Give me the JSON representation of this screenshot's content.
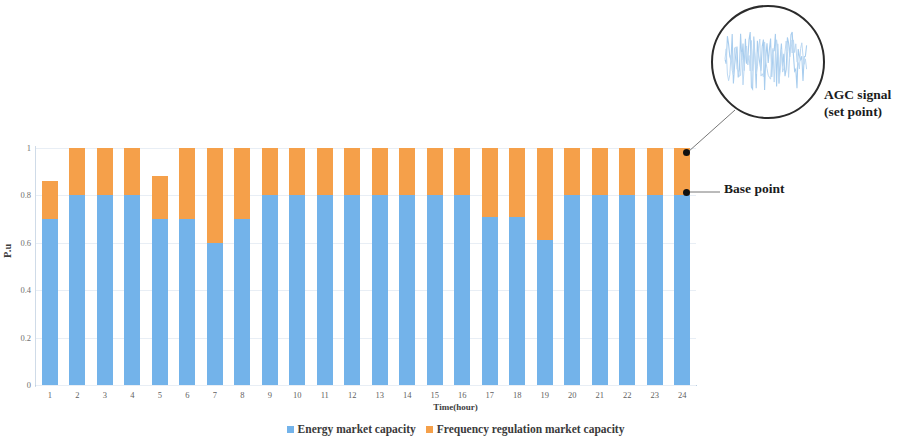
{
  "chart_data": {
    "type": "bar",
    "stacked": true,
    "title": "",
    "xlabel": "Time(hour)",
    "ylabel": "P.u",
    "ylim": [
      0,
      1
    ],
    "yticks": [
      "0",
      "0.2",
      "0.4",
      "0.6",
      "0.8",
      "1"
    ],
    "ytick_values": [
      0,
      0.2,
      0.4,
      0.6,
      0.8,
      1
    ],
    "grid": true,
    "legend_position": "bottom",
    "categories": [
      "1",
      "2",
      "3",
      "4",
      "5",
      "6",
      "7",
      "8",
      "9",
      "10",
      "11",
      "12",
      "13",
      "14",
      "15",
      "16",
      "17",
      "18",
      "19",
      "20",
      "21",
      "22",
      "23",
      "24"
    ],
    "series": [
      {
        "name": "Energy market capacity",
        "color": "#73b3ea",
        "values": [
          0.7,
          0.8,
          0.8,
          0.8,
          0.7,
          0.7,
          0.6,
          0.7,
          0.8,
          0.8,
          0.8,
          0.8,
          0.8,
          0.8,
          0.8,
          0.8,
          0.71,
          0.71,
          0.61,
          0.8,
          0.8,
          0.8,
          0.8,
          0.8
        ]
      },
      {
        "name": "Frequency regulation market capacity",
        "color": "#f5a04a",
        "values": [
          0.16,
          0.2,
          0.2,
          0.2,
          0.18,
          0.3,
          0.4,
          0.3,
          0.2,
          0.2,
          0.2,
          0.2,
          0.2,
          0.2,
          0.2,
          0.2,
          0.29,
          0.29,
          0.39,
          0.2,
          0.2,
          0.2,
          0.2,
          0.2
        ]
      }
    ],
    "totals": [
      0.86,
      1.0,
      1.0,
      1.0,
      0.88,
      1.0,
      1.0,
      1.0,
      1.0,
      1.0,
      1.0,
      1.0,
      1.0,
      1.0,
      1.0,
      1.0,
      1.0,
      1.0,
      1.0,
      1.0,
      1.0,
      1.0,
      1.0,
      1.0
    ],
    "annotations": [
      {
        "id": "agc",
        "label": "AGC signal\n(set point)",
        "line1": "AGC signal",
        "line2": "(set point)",
        "target_category": "24",
        "target_value": 1.0
      },
      {
        "id": "base",
        "label": "Base point",
        "line1": "Base point",
        "line2": "",
        "target_category": "24",
        "target_value": 0.8
      }
    ]
  },
  "legend": {
    "items": [
      {
        "label": "Energy market capacity",
        "color": "#73b3ea",
        "swatch": "square-marker"
      },
      {
        "label": "Frequency regulation market capacity",
        "color": "#f5a04a",
        "swatch": "square-marker"
      }
    ]
  },
  "axes": {
    "y_title": "P.u",
    "x_title": "Time(hour)",
    "y_ticks": [
      "1",
      "0.8",
      "0.6",
      "0.4",
      "0.2",
      "0"
    ],
    "x_ticks": [
      "1",
      "2",
      "3",
      "4",
      "5",
      "6",
      "7",
      "8",
      "9",
      "10",
      "11",
      "12",
      "13",
      "14",
      "15",
      "16",
      "17",
      "18",
      "19",
      "20",
      "21",
      "22",
      "23",
      "24"
    ]
  },
  "callout": {
    "name": "magnifier-circle",
    "description": "AGC signal waveform detail",
    "signal_color": "#a8cdee"
  },
  "colors": {
    "energy_blue": "#73b3ea",
    "regulation_orange": "#f5a04a",
    "gridline": "#e8eef5",
    "marker_dot": "#111111"
  }
}
